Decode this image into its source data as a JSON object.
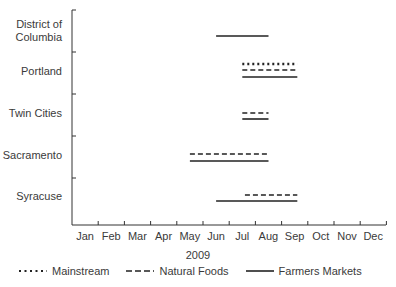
{
  "chart_data": {
    "type": "gantt-range",
    "title": "",
    "xlabel": "2009",
    "ylabel": "",
    "categories": [
      "District of Columbia",
      "Portland",
      "Twin Cities",
      "Sacramento",
      "Syracuse"
    ],
    "x_tick_labels": [
      "Jan",
      "Feb",
      "Mar",
      "Apr",
      "May",
      "Jun",
      "Jul",
      "Aug",
      "Sep",
      "Oct",
      "Nov",
      "Dec"
    ],
    "x_unit": "month index (0 = start of Jan, 12 = end of Dec)",
    "series": [
      {
        "name": "Mainstream",
        "style": "dotted",
        "ranges": {
          "Portland": [
            6.5,
            8.6
          ]
        }
      },
      {
        "name": "Natural Foods",
        "style": "dashed",
        "ranges": {
          "Portland": [
            6.5,
            8.6
          ],
          "Twin Cities": [
            6.5,
            7.5
          ],
          "Sacramento": [
            4.5,
            7.5
          ],
          "Syracuse": [
            6.6,
            8.6
          ]
        }
      },
      {
        "name": "Farmers Markets",
        "style": "solid",
        "ranges": {
          "District of Columbia": [
            5.5,
            7.5
          ],
          "Portland": [
            6.5,
            8.6
          ],
          "Twin Cities": [
            6.5,
            7.5
          ],
          "Sacramento": [
            4.5,
            7.5
          ],
          "Syracuse": [
            5.5,
            8.6
          ]
        }
      }
    ],
    "legend_position": "bottom",
    "grid": false
  },
  "labels": {
    "y": [
      "District of",
      "Columbia",
      "Portland",
      "Twin Cities",
      "Sacramento",
      "Syracuse"
    ],
    "x": [
      "Jan",
      "Feb",
      "Mar",
      "Apr",
      "May",
      "Jun",
      "Jul",
      "Aug",
      "Sep",
      "Oct",
      "Nov",
      "Dec"
    ],
    "x_title": "2009"
  },
  "legend": {
    "mainstream": "Mainstream",
    "natural": "Natural Foods",
    "farmers": "Farmers Markets"
  }
}
